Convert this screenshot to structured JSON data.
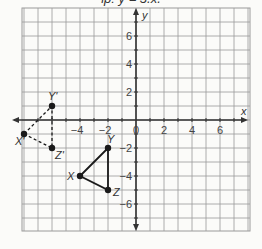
{
  "caption": "ip: y = 3.x.",
  "chart_data": {
    "type": "scatter",
    "title": "",
    "xlabel": "x",
    "ylabel": "y",
    "xlim": [
      -8,
      8
    ],
    "ylim": [
      -8,
      8
    ],
    "grid": true,
    "x_ticks": [
      -4,
      -2,
      0,
      2,
      4,
      6
    ],
    "y_ticks": [
      6,
      4,
      2,
      -2,
      -4,
      -6
    ],
    "series": [
      {
        "name": "Triangle XYZ",
        "style": "solid",
        "points": [
          {
            "label": "X",
            "x": -4,
            "y": -4
          },
          {
            "label": "Y",
            "x": -2,
            "y": -2
          },
          {
            "label": "Z",
            "x": -2,
            "y": -5
          }
        ]
      },
      {
        "name": "Triangle X'Y'Z'",
        "style": "dashed",
        "points": [
          {
            "label": "X'",
            "x": -8,
            "y": -1
          },
          {
            "label": "Y'",
            "x": -6,
            "y": 1
          },
          {
            "label": "Z'",
            "x": -6,
            "y": -2
          }
        ]
      }
    ]
  },
  "axis": {
    "x_label": "x",
    "y_label": "y",
    "origin_label": "0"
  },
  "colors": {
    "grid": "#9a9a9a",
    "axis": "#333333",
    "shape": "#1a1a1a"
  }
}
